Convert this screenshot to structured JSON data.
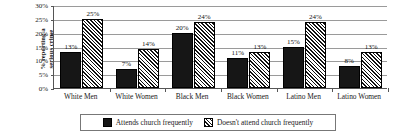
{
  "chart_data": {
    "type": "bar",
    "title": "",
    "subtitle": "",
    "xlabel": "",
    "ylabel": "% reporting a serious crime",
    "ylabel_lines": [
      "% reporting a",
      "serious crime"
    ],
    "categories": [
      "White Men",
      "White Women",
      "Black Men",
      "Black Women",
      "Latino Men",
      "Latino Women"
    ],
    "series": [
      {
        "name": "Attends church frequently",
        "pattern": "solid",
        "color": "#161616",
        "values": [
          13,
          7,
          20,
          11,
          15,
          8
        ],
        "labels": [
          "13%",
          "7%",
          "20%",
          "11%",
          "15%",
          "8%"
        ]
      },
      {
        "name": "Doesn't attend church frequently",
        "pattern": "diagonal-hatch",
        "color": "#ffffff",
        "values": [
          25,
          14,
          24,
          13,
          24,
          13
        ],
        "labels": [
          "25%",
          "14%",
          "24%",
          "13%",
          "24%",
          "13%"
        ]
      }
    ],
    "ylim": [
      0,
      30
    ],
    "ytick_values": [
      0,
      5,
      10,
      15,
      20,
      25,
      30
    ],
    "ytick_labels": [
      "0%",
      "5%",
      "10%",
      "15%",
      "20%",
      "25%",
      "30%"
    ],
    "grid": true,
    "grid_axis": "y",
    "legend_position": "bottom",
    "legend_entries": [
      "Attends church frequently",
      "Doesn't attend church frequently"
    ],
    "value_labels_shown": true,
    "axis_color": "#555555",
    "gridline_color": "#9a9a9a"
  }
}
